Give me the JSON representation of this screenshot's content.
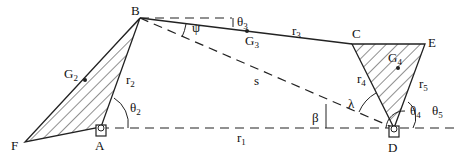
{
  "diagram": {
    "type": "six-bar linkage kinematic diagram",
    "points": {
      "A": {
        "label": "A",
        "x": 101,
        "y": 127
      },
      "B": {
        "label": "B",
        "x": 140,
        "y": 18
      },
      "C": {
        "label": "C",
        "x": 352,
        "y": 44
      },
      "D": {
        "label": "D",
        "x": 394,
        "y": 128
      },
      "E": {
        "label": "E",
        "x": 425,
        "y": 44
      },
      "F": {
        "label": "F",
        "x": 25,
        "y": 142
      }
    },
    "links": {
      "r1": "r",
      "r2": "r",
      "r3": "r",
      "r4": "r",
      "r5": "r",
      "s": "s"
    },
    "link_subs": {
      "r1": "1",
      "r2": "2",
      "r3": "3",
      "r4": "4",
      "r5": "5"
    },
    "centers_of_mass": {
      "G2": {
        "base": "G",
        "sub": "2"
      },
      "G3": {
        "base": "G",
        "sub": "3"
      },
      "G4": {
        "base": "G",
        "sub": "4"
      }
    },
    "angles": {
      "theta2": {
        "base": "θ",
        "sub": "2"
      },
      "theta3": {
        "base": "θ",
        "sub": "3"
      },
      "theta4": {
        "base": "θ",
        "sub": "4"
      },
      "theta5": {
        "base": "θ",
        "sub": "5"
      },
      "psi": "ψ",
      "beta": "β",
      "lambda": "λ"
    },
    "ground_pivots": [
      "A",
      "D"
    ],
    "colors": {
      "stroke": "#222222",
      "hatch": "#222222",
      "background": "#ffffff"
    }
  }
}
